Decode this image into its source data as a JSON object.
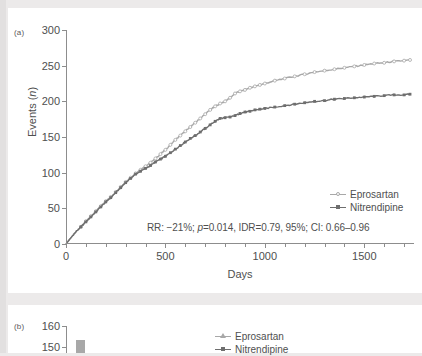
{
  "figure": {
    "panel_a_label": "(a)",
    "panel_b_label": "(b)"
  },
  "colors": {
    "eprosartan": "#a8a8a8",
    "nitrendipine": "#6e6e6e",
    "axis": "#8d8d8d",
    "text": "#4f4f4f",
    "page_background": "#eceaea",
    "card_background": "#ffffff"
  },
  "panel_a": {
    "xlabel": "Days",
    "ylabel": "Events (n)",
    "annotation": "RR: −21%; p=0.014, IDR=0.79, 95%; CI: 0.66–0.96",
    "annotation_parts": {
      "rr": "RR: −21%;",
      "p_italic": "p",
      "p_value": "=0.014, IDR=0.79, 95%; CI: 0.66–0.96"
    },
    "ytick_labels": [
      "300",
      "250",
      "200",
      "150",
      "100",
      "50",
      "0"
    ],
    "xtick_labels": [
      "0",
      "500",
      "1000",
      "1500"
    ],
    "legend": [
      {
        "label": "Eprosartan",
        "marker": "circle-open-icon"
      },
      {
        "label": "Nitrendipine",
        "marker": "square-filled-icon"
      }
    ]
  },
  "panel_b": {
    "ytick_labels": [
      "160",
      "150"
    ],
    "legend": [
      {
        "label": "Eprosartan",
        "marker": "triangle-filled-icon"
      },
      {
        "label": "Nitrendipine",
        "marker": "square-filled-icon"
      }
    ]
  },
  "chart_data": {
    "type": "line",
    "title": "",
    "xlabel": "Days",
    "ylabel": "Events (n)",
    "xlim": [
      0,
      1750
    ],
    "ylim": [
      0,
      300
    ],
    "xticks": [
      0,
      500,
      1000,
      1500
    ],
    "xticks_minor_step": 100,
    "yticks": [
      0,
      50,
      100,
      150,
      200,
      250,
      300
    ],
    "grid": false,
    "legend_position": "inside-right",
    "annotation": "RR: −21%; p=0.014, IDR=0.79, 95%; CI: 0.66–0.96",
    "statistics": {
      "relative_risk_percent": -21,
      "p_value": 0.014,
      "IDR": 0.79,
      "confidence_level": "95%",
      "CI_low": 0.66,
      "CI_high": 0.96
    },
    "series": [
      {
        "name": "Eprosartan",
        "marker": "circle-open",
        "color": "#a8a8a8",
        "x": [
          0,
          25,
          50,
          75,
          100,
          125,
          150,
          175,
          200,
          225,
          250,
          275,
          300,
          325,
          350,
          375,
          400,
          425,
          450,
          475,
          500,
          525,
          550,
          575,
          600,
          625,
          650,
          675,
          700,
          725,
          750,
          775,
          800,
          825,
          850,
          875,
          900,
          925,
          950,
          975,
          1000,
          1050,
          1100,
          1150,
          1200,
          1250,
          1300,
          1350,
          1400,
          1450,
          1500,
          1550,
          1600,
          1650,
          1700,
          1730
        ],
        "y": [
          0,
          9,
          17,
          24,
          32,
          39,
          46,
          53,
          60,
          66,
          73,
          80,
          87,
          93,
          99,
          104,
          109,
          114,
          120,
          126,
          132,
          139,
          146,
          152,
          158,
          164,
          170,
          176,
          182,
          188,
          193,
          197,
          200,
          205,
          211,
          214,
          216,
          219,
          221,
          223,
          225,
          229,
          232,
          235,
          238,
          241,
          243,
          245,
          247,
          249,
          251,
          253,
          254,
          256,
          257,
          258
        ]
      },
      {
        "name": "Nitrendipine",
        "marker": "square-filled",
        "color": "#6e6e6e",
        "x": [
          0,
          25,
          50,
          75,
          100,
          125,
          150,
          175,
          200,
          225,
          250,
          275,
          300,
          325,
          350,
          375,
          400,
          425,
          450,
          475,
          500,
          525,
          550,
          575,
          600,
          625,
          650,
          675,
          700,
          725,
          750,
          775,
          800,
          825,
          850,
          875,
          900,
          925,
          950,
          975,
          1000,
          1050,
          1100,
          1150,
          1200,
          1250,
          1300,
          1350,
          1400,
          1450,
          1500,
          1550,
          1600,
          1650,
          1700,
          1730
        ],
        "y": [
          0,
          9,
          17,
          24,
          31,
          38,
          45,
          52,
          59,
          65,
          72,
          79,
          86,
          92,
          98,
          102,
          106,
          110,
          115,
          119,
          123,
          128,
          133,
          138,
          143,
          148,
          152,
          157,
          162,
          167,
          172,
          176,
          177,
          178,
          180,
          183,
          185,
          186,
          188,
          189,
          190,
          192,
          194,
          196,
          198,
          200,
          201,
          203,
          204,
          205,
          206,
          207,
          208,
          209,
          209,
          210
        ]
      }
    ]
  }
}
